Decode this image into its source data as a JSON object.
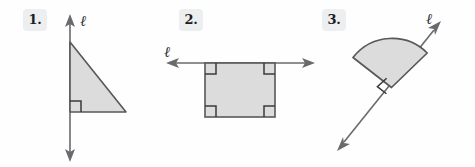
{
  "page": {
    "background_color": "#fefefe",
    "width": 475,
    "height": 167
  },
  "style": {
    "shape_fill": "#dcdcdc",
    "shape_stroke": "#58585a",
    "line_stroke": "#6a6a6e",
    "badge_bg": "#eceef0",
    "badge_text_color": "#1d1d1f",
    "label_color": "#303033"
  },
  "problems": [
    {
      "number": "1.",
      "badge_label": "1.",
      "line_label": "ℓ",
      "line_name": "line-l-vertical",
      "line_orientation": "vertical",
      "line_arrows": "both",
      "shape": "right-triangle",
      "shape_name": "right-triangle",
      "right_angle_marks": 1,
      "description": "Right triangle with its vertical leg lying on line ℓ; right angle at the bottom-left vertex."
    },
    {
      "number": "2.",
      "badge_label": "2.",
      "line_label": "ℓ",
      "line_name": "line-l-horizontal",
      "line_orientation": "horizontal",
      "line_arrows": "both",
      "shape": "rectangle",
      "shape_name": "rectangle",
      "right_angle_marks": 4,
      "description": "Rectangle whose top edge lies on horizontal line ℓ; right angle marks at all four corners."
    },
    {
      "number": "3.",
      "badge_label": "3.",
      "line_label": "ℓ",
      "line_name": "line-l-diagonal",
      "line_orientation": "diagonal",
      "line_arrows": "both",
      "shape": "circular-sector",
      "shape_name": "circular-sector",
      "right_angle_marks": 1,
      "description": "Circular sector (pie wedge) with its vertex on diagonal line ℓ; right angle mark at the vertex."
    }
  ]
}
